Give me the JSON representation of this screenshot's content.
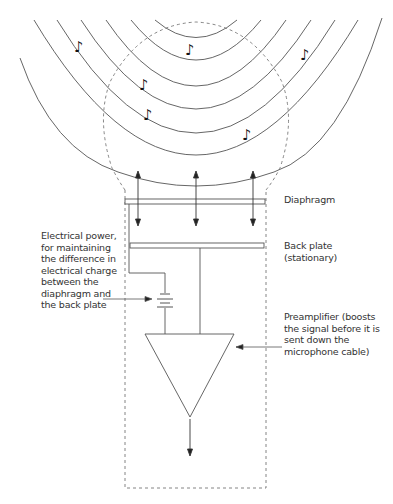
{
  "diagram": {
    "type": "microphone-condenser-schematic",
    "labels": {
      "diaphragm": "Diaphragm",
      "back_plate": "Back plate",
      "back_plate_note": "(stationary)",
      "power_lines": [
        "Electrical power,",
        "for maintaining",
        "the difference in",
        "electrical charge",
        "between the",
        "diaphragm and",
        "the back plate"
      ],
      "preamp_lines": [
        "Preamplifier (boosts",
        "the signal before it is",
        "sent down the",
        "microphone cable)"
      ]
    },
    "symbols": {
      "music_note": "♪",
      "note_count": 6
    },
    "colors": {
      "line": "#555555",
      "text": "#333333",
      "dash": "#777777"
    }
  }
}
